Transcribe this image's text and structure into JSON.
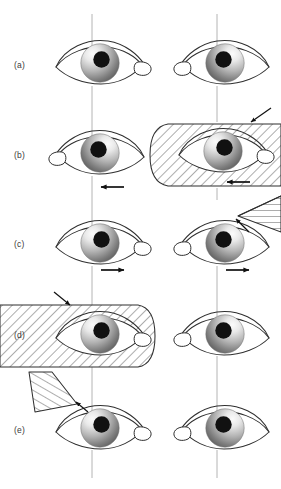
{
  "figure": {
    "width": 281,
    "height": 489,
    "background": "#ffffff",
    "line_color": "#3a3a3a",
    "reference_line_color": "#b4b4b4",
    "hatch_color": "#555555",
    "occluder_fill": "#ffffff",
    "iris_light": "#f2f2f2",
    "iris_dark": "#5a5a5a",
    "pupil_color": "#111111"
  },
  "columns": {
    "left_axis_x": 92,
    "right_axis_x": 217
  },
  "rows": [
    {
      "id": "a",
      "label": "(a)",
      "label_x": 14,
      "label_y": 63,
      "eye_cy": 65,
      "left_eye": {
        "name": "left-eye",
        "cx": 100,
        "gaze": 4,
        "occluded": false
      },
      "right_eye": {
        "name": "right-eye",
        "cx": 225,
        "gaze": 0,
        "occluded": false
      },
      "arrows": [],
      "occluders": []
    },
    {
      "id": "b",
      "label": "(b)",
      "label_x": 14,
      "label_y": 152,
      "eye_cy": 155,
      "left_eye": {
        "name": "left-eye",
        "cx": 100,
        "gaze": 0,
        "occluded": false
      },
      "right_eye": {
        "name": "right-eye",
        "cx": 225,
        "gaze": -4,
        "occluded": true
      },
      "arrows": [
        {
          "name": "motion-arrow-left-eye",
          "direction": "left",
          "x": 112,
          "y": 187
        },
        {
          "name": "motion-arrow-right-eye",
          "direction": "left",
          "x": 237,
          "y": 187
        },
        {
          "name": "occluder-pointer-arrow",
          "direction": "down-left",
          "x": 258,
          "y": 116
        }
      ],
      "occluders": [
        {
          "name": "occluder-paddle-right-eye",
          "shape": "rounded-left",
          "x": 150,
          "y": 124,
          "w": 131,
          "h": 62
        }
      ]
    },
    {
      "id": "c",
      "label": "(c)",
      "label_x": 14,
      "label_y": 240,
      "eye_cy": 245,
      "left_eye": {
        "name": "left-eye",
        "cx": 100,
        "gaze": 4,
        "occluded": false
      },
      "right_eye": {
        "name": "right-eye",
        "cx": 225,
        "gaze": 0,
        "occluded": false
      },
      "arrows": [
        {
          "name": "motion-arrow-left-eye",
          "direction": "right",
          "x": 112,
          "y": 270
        },
        {
          "name": "motion-arrow-right-eye",
          "direction": "right",
          "x": 237,
          "y": 270
        },
        {
          "name": "occluder-pointer-arrow",
          "direction": "up-right",
          "x": 240,
          "y": 219
        }
      ],
      "occluders": [
        {
          "name": "occluder-wedge-right",
          "shape": "wedge-up-right",
          "x": 232,
          "y": 196,
          "w": 49,
          "h": 32
        }
      ]
    },
    {
      "id": "d",
      "label": "(d)",
      "label_x": 14,
      "label_y": 331,
      "eye_cy": 336,
      "left_eye": {
        "name": "left-eye",
        "cx": 100,
        "gaze": 4,
        "occluded": true
      },
      "right_eye": {
        "name": "right-eye",
        "cx": 225,
        "gaze": 0,
        "occluded": false
      },
      "arrows": [
        {
          "name": "occluder-pointer-arrow",
          "direction": "down-right",
          "x": 62,
          "y": 296
        }
      ],
      "occluders": [
        {
          "name": "occluder-paddle-left-eye",
          "shape": "rounded-right",
          "x": 0,
          "y": 305,
          "w": 155,
          "h": 62
        }
      ]
    },
    {
      "id": "e",
      "label": "(e)",
      "label_x": 14,
      "label_y": 427,
      "eye_cy": 430,
      "left_eye": {
        "name": "left-eye",
        "cx": 100,
        "gaze": 4,
        "occluded": false
      },
      "right_eye": {
        "name": "right-eye",
        "cx": 225,
        "gaze": 0,
        "occluded": false
      },
      "arrows": [
        {
          "name": "occluder-pointer-arrow",
          "direction": "up-left",
          "x": 72,
          "y": 396
        }
      ],
      "occluders": [
        {
          "name": "occluder-wedge-left",
          "shape": "wedge-up-left",
          "x": 28,
          "y": 372,
          "w": 50,
          "h": 40
        }
      ]
    }
  ],
  "reference_lines": [
    {
      "name": "reference-line",
      "x": 92,
      "y1": 14,
      "y2": 46
    },
    {
      "name": "reference-line",
      "x": 217,
      "y1": 14,
      "y2": 46
    },
    {
      "name": "reference-line",
      "x": 92,
      "y1": 86,
      "y2": 136
    },
    {
      "name": "reference-line",
      "x": 217,
      "y1": 86,
      "y2": 122
    },
    {
      "name": "reference-line",
      "x": 92,
      "y1": 176,
      "y2": 226
    },
    {
      "name": "reference-line",
      "x": 217,
      "y1": 188,
      "y2": 200
    },
    {
      "name": "reference-line",
      "x": 217,
      "y1": 176,
      "y2": 182
    },
    {
      "name": "reference-line",
      "x": 92,
      "y1": 266,
      "y2": 306
    },
    {
      "name": "reference-line",
      "x": 217,
      "y1": 266,
      "y2": 316
    },
    {
      "name": "reference-line",
      "x": 92,
      "y1": 366,
      "y2": 412
    },
    {
      "name": "reference-line",
      "x": 217,
      "y1": 356,
      "y2": 412
    },
    {
      "name": "reference-line",
      "x": 92,
      "y1": 450,
      "y2": 478
    },
    {
      "name": "reference-line",
      "x": 217,
      "y1": 450,
      "y2": 478
    }
  ]
}
